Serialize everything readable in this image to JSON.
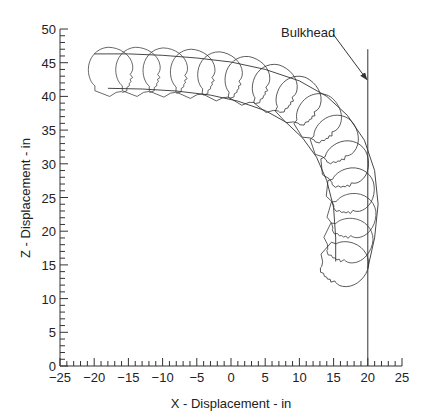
{
  "chart_data": {
    "type": "line",
    "title": "",
    "xlabel": "X - Displacement - in",
    "ylabel": "Z - Displacement - in",
    "xlim": [
      -25,
      25
    ],
    "ylim": [
      0,
      50
    ],
    "grid": false,
    "legend": null,
    "x_ticks": [
      -25,
      -20,
      -15,
      -10,
      -5,
      0,
      5,
      10,
      15,
      20,
      25
    ],
    "x_tick_labels": [
      "−25",
      "−20",
      "−15",
      "−10",
      "−5",
      "0",
      "5",
      "10",
      "15",
      "20",
      "25"
    ],
    "y_ticks": [
      0,
      5,
      10,
      15,
      20,
      25,
      30,
      35,
      40,
      45,
      50
    ],
    "y_tick_labels": [
      "0",
      "5",
      "10",
      "15",
      "20",
      "25",
      "30",
      "35",
      "40",
      "45",
      "50"
    ],
    "annotations": [
      {
        "text": "Bulkhead",
        "x": 17.0,
        "z": 47.5,
        "arrow_to": {
          "x": 20,
          "z": 42.5
        }
      }
    ],
    "bulkhead": {
      "x": 20,
      "z_range": [
        0,
        47
      ]
    },
    "series": [
      {
        "name": "head-top-trajectory",
        "points": [
          [
            -20,
            46.3
          ],
          [
            -15,
            46.3
          ],
          [
            -10,
            46.1
          ],
          [
            -5,
            45.7
          ],
          [
            0,
            45.1
          ],
          [
            5,
            44.0
          ],
          [
            10,
            42.3
          ],
          [
            14,
            40.0
          ],
          [
            17,
            37.2
          ],
          [
            19.5,
            33.5
          ],
          [
            21,
            29.0
          ],
          [
            21.5,
            24.0
          ],
          [
            21,
            19.0
          ],
          [
            20,
            14.5
          ]
        ]
      },
      {
        "name": "chin-trajectory",
        "points": [
          [
            -18,
            41.2
          ],
          [
            -13,
            41.1
          ],
          [
            -8,
            40.8
          ],
          [
            -3,
            40.2
          ],
          [
            1,
            39.3
          ],
          [
            5,
            37.9
          ],
          [
            8,
            36.2
          ],
          [
            10.5,
            33.8
          ],
          [
            12.5,
            31.0
          ],
          [
            14,
            27.5
          ],
          [
            15,
            23.5
          ],
          [
            15.3,
            19.0
          ],
          [
            15.3,
            15.5
          ]
        ]
      }
    ],
    "head_frames": [
      {
        "x": -17.5,
        "z": 44.0,
        "rotation_deg": 0
      },
      {
        "x": -13.5,
        "z": 44.0,
        "rotation_deg": 0
      },
      {
        "x": -9.5,
        "z": 43.9,
        "rotation_deg": 1
      },
      {
        "x": -5.5,
        "z": 43.7,
        "rotation_deg": 3
      },
      {
        "x": -1.5,
        "z": 43.3,
        "rotation_deg": 6
      },
      {
        "x": 2.5,
        "z": 42.6,
        "rotation_deg": 10
      },
      {
        "x": 6.5,
        "z": 41.4,
        "rotation_deg": 17
      },
      {
        "x": 10.0,
        "z": 39.6,
        "rotation_deg": 26
      },
      {
        "x": 13.0,
        "z": 37.0,
        "rotation_deg": 37
      },
      {
        "x": 15.5,
        "z": 33.8,
        "rotation_deg": 50
      },
      {
        "x": 17.0,
        "z": 30.0,
        "rotation_deg": 63
      },
      {
        "x": 17.8,
        "z": 26.0,
        "rotation_deg": 75
      },
      {
        "x": 18.0,
        "z": 22.2,
        "rotation_deg": 85
      },
      {
        "x": 17.5,
        "z": 18.5,
        "rotation_deg": 95
      },
      {
        "x": 16.8,
        "z": 15.0,
        "rotation_deg": 110
      }
    ]
  },
  "labels": {
    "xlabel": "X - Displacement - in",
    "ylabel": "Z - Displacement - in",
    "bulkhead": "Bulkhead"
  }
}
